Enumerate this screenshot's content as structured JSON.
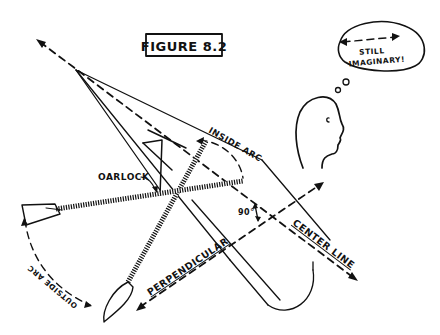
{
  "figure": {
    "title": "FIGURE 8.2"
  },
  "thought_bubble": {
    "line1": "STILL",
    "line2": "IMAGINARY!"
  },
  "labels": {
    "inside_arc": "INSIDE ARC",
    "oarlock": "OARLOCK",
    "outside_arc": "OUTSIDE ARC",
    "perpendicular": "PERPENDICULAR",
    "center_line": "CENTER LINE",
    "angle": "90°"
  },
  "colors": {
    "ink": "#111111",
    "background": "#ffffff"
  }
}
